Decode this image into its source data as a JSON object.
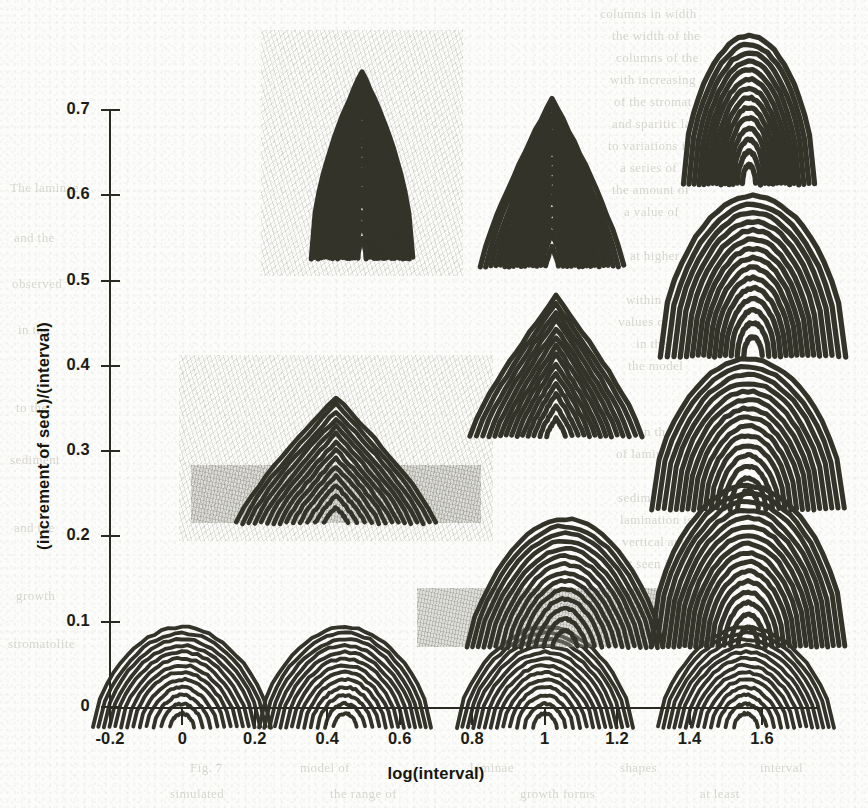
{
  "figure": {
    "background_color": "#fcfcfa",
    "ink_color": "#33332a"
  },
  "chart_data": {
    "type": "scatter",
    "title": "",
    "xlabel": "log(interval)",
    "ylabel": "(increment of sed.)/(interval)",
    "xlim": [
      -0.25,
      1.78
    ],
    "ylim": [
      0,
      0.74
    ],
    "xticks": [
      -0.2,
      0,
      0.2,
      0.4,
      0.6,
      0.8,
      1,
      1.2,
      1.4,
      1.6
    ],
    "xticklabels": [
      "-0.2",
      "0",
      "0.2",
      "0.4",
      "0.6",
      "0.8",
      "1",
      "1.2",
      "1.4",
      "1.6"
    ],
    "yticks": [
      0,
      0.1,
      0.2,
      0.3,
      0.4,
      0.5,
      0.6,
      0.7
    ],
    "yticklabels": [
      "0",
      "0.1",
      "0.2",
      "0.3",
      "0.4",
      "0.5",
      "0.6",
      "0.7"
    ],
    "grid": false,
    "legend": null,
    "marker_style": "simulated-stromatolite-growth-form",
    "point_label": "growth-form",
    "points": [
      {
        "id": "form-r1c1",
        "x": 0.0,
        "y": 0.035,
        "shape": "broad-dome",
        "width_px": 178,
        "height_px": 100,
        "laminae": 13,
        "substrate": false,
        "halo": false,
        "flare": 0.0
      },
      {
        "id": "form-r1c2",
        "x": 0.45,
        "y": 0.035,
        "shape": "broad-dome",
        "width_px": 172,
        "height_px": 100,
        "laminae": 13,
        "substrate": false,
        "halo": false,
        "flare": 0.0
      },
      {
        "id": "form-r1c3",
        "x": 1.0,
        "y": 0.035,
        "shape": "broad-dome",
        "width_px": 176,
        "height_px": 100,
        "laminae": 13,
        "substrate": false,
        "halo": false,
        "flare": 0.0
      },
      {
        "id": "form-r1c4",
        "x": 1.555,
        "y": 0.035,
        "shape": "broad-dome",
        "width_px": 176,
        "height_px": 100,
        "laminae": 13,
        "substrate": false,
        "halo": false,
        "flare": 0.0
      },
      {
        "id": "form-r2c3",
        "x": 1.055,
        "y": 0.145,
        "shape": "broad-dome-steep",
        "width_px": 196,
        "height_px": 128,
        "laminae": 14,
        "substrate": true,
        "halo": false,
        "flare": 0.0
      },
      {
        "id": "form-r2c4",
        "x": 1.56,
        "y": 0.165,
        "shape": "columnar-dome",
        "width_px": 176,
        "height_px": 160,
        "laminae": 16,
        "substrate": false,
        "halo": false,
        "flare": 0.1
      },
      {
        "id": "form-r3c2",
        "x": 0.425,
        "y": 0.29,
        "shape": "conical-pyramid",
        "width_px": 190,
        "height_px": 126,
        "laminae": 14,
        "substrate": true,
        "halo": true,
        "flare": 0.05
      },
      {
        "id": "form-r3c4",
        "x": 1.56,
        "y": 0.32,
        "shape": "columnar-dome",
        "width_px": 172,
        "height_px": 150,
        "laminae": 15,
        "substrate": false,
        "halo": false,
        "flare": 0.12
      },
      {
        "id": "form-r4c3",
        "x": 1.03,
        "y": 0.4,
        "shape": "conical-flare",
        "width_px": 146,
        "height_px": 140,
        "laminae": 14,
        "substrate": false,
        "halo": false,
        "flare": 0.18
      },
      {
        "id": "form-r4c4",
        "x": 1.575,
        "y": 0.505,
        "shape": "columnar-flare",
        "width_px": 152,
        "height_px": 160,
        "laminae": 15,
        "substrate": false,
        "halo": false,
        "flare": 0.22
      },
      {
        "id": "form-r5c2",
        "x": 0.495,
        "y": 0.635,
        "shape": "narrow-spire",
        "width_px": 78,
        "height_px": 186,
        "laminae": 18,
        "substrate": false,
        "halo": true,
        "flare": 0.3
      },
      {
        "id": "form-r5c3",
        "x": 1.02,
        "y": 0.615,
        "shape": "narrow-cone",
        "width_px": 112,
        "height_px": 168,
        "laminae": 16,
        "substrate": false,
        "halo": false,
        "flare": 0.28
      },
      {
        "id": "form-r5c4",
        "x": 1.565,
        "y": 0.7,
        "shape": "narrow-column",
        "width_px": 104,
        "height_px": 148,
        "laminae": 14,
        "substrate": false,
        "halo": false,
        "flare": 0.26
      }
    ]
  },
  "bleed_text": {
    "note": "faint show-through of text from the reverse side of the scanned page (illegible)",
    "lines": [
      {
        "text": "columns in width",
        "x": 600,
        "y": 6
      },
      {
        "text": "the width of the",
        "x": 612,
        "y": 28
      },
      {
        "text": "columns of the",
        "x": 616,
        "y": 50
      },
      {
        "text": "with increasing",
        "x": 610,
        "y": 72
      },
      {
        "text": "of the stromat",
        "x": 614,
        "y": 94
      },
      {
        "text": "and sparitic la",
        "x": 612,
        "y": 116
      },
      {
        "text": "to variations in",
        "x": 608,
        "y": 138
      },
      {
        "text": "a series of",
        "x": 620,
        "y": 160
      },
      {
        "text": "the amount of",
        "x": 612,
        "y": 182
      },
      {
        "text": "a value of",
        "x": 624,
        "y": 204
      },
      {
        "text": "at higher",
        "x": 630,
        "y": 248
      },
      {
        "text": "within the",
        "x": 626,
        "y": 292
      },
      {
        "text": "values of the",
        "x": 618,
        "y": 314
      },
      {
        "text": "in the",
        "x": 636,
        "y": 336
      },
      {
        "text": "the model",
        "x": 628,
        "y": 358
      },
      {
        "text": "in the",
        "x": 640,
        "y": 424
      },
      {
        "text": "of laminae are",
        "x": 616,
        "y": 446
      },
      {
        "text": "sediment and",
        "x": 618,
        "y": 490
      },
      {
        "text": "lamination is",
        "x": 620,
        "y": 512
      },
      {
        "text": "vertical and",
        "x": 622,
        "y": 534
      },
      {
        "text": "best seen in the",
        "x": 610,
        "y": 556
      },
      {
        "text": "model is at least",
        "x": 606,
        "y": 600
      },
      {
        "text": "The laminae",
        "x": 10,
        "y": 180
      },
      {
        "text": "and the",
        "x": 14,
        "y": 230
      },
      {
        "text": "observed",
        "x": 12,
        "y": 276
      },
      {
        "text": "in the",
        "x": 18,
        "y": 322
      },
      {
        "text": "to the",
        "x": 16,
        "y": 400
      },
      {
        "text": "sediment",
        "x": 10,
        "y": 452
      },
      {
        "text": "and the",
        "x": 14,
        "y": 520
      },
      {
        "text": "growth",
        "x": 16,
        "y": 588
      },
      {
        "text": "stromatolite",
        "x": 8,
        "y": 636
      },
      {
        "text": "Fig. 7",
        "x": 190,
        "y": 760
      },
      {
        "text": "model of",
        "x": 300,
        "y": 760
      },
      {
        "text": "laminae",
        "x": 470,
        "y": 760
      },
      {
        "text": "shapes",
        "x": 620,
        "y": 760
      },
      {
        "text": "interval",
        "x": 760,
        "y": 760
      },
      {
        "text": "simulated",
        "x": 170,
        "y": 786
      },
      {
        "text": "the range of",
        "x": 330,
        "y": 786
      },
      {
        "text": "growth forms",
        "x": 520,
        "y": 786
      },
      {
        "text": "at least",
        "x": 700,
        "y": 786
      }
    ]
  }
}
